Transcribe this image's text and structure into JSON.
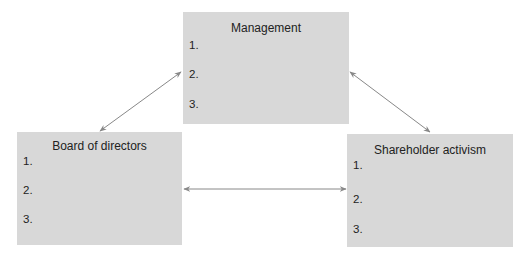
{
  "diagram": {
    "boxes": [
      {
        "id": "management",
        "title": "Management",
        "items": [
          "1.",
          "2.",
          "3."
        ]
      },
      {
        "id": "board",
        "title": "Board of directors",
        "items": [
          "1.",
          "2.",
          "3."
        ]
      },
      {
        "id": "shareholder",
        "title": "Shareholder activism",
        "items": [
          "1.",
          "2.",
          "3."
        ]
      }
    ],
    "connections": [
      {
        "from": "management",
        "to": "board",
        "type": "bidirectional"
      },
      {
        "from": "management",
        "to": "shareholder",
        "type": "bidirectional"
      },
      {
        "from": "board",
        "to": "shareholder",
        "type": "bidirectional"
      }
    ],
    "colors": {
      "box_fill": "#d8d8d8",
      "arrow": "#888888"
    }
  }
}
